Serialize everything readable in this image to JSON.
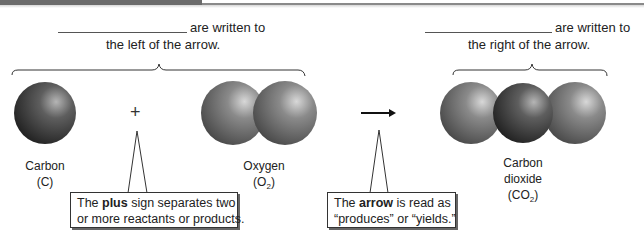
{
  "header": {
    "bar_color": "#6b6b6b",
    "rule_color": "#8a8a8a"
  },
  "reactants_prompt": {
    "blank": "",
    "line1": "are written to",
    "line2": "the left of the arrow."
  },
  "products_prompt": {
    "blank": "",
    "line1": "are written to",
    "line2": "the right of the arrow."
  },
  "symbols": {
    "plus": "+",
    "arrow": "→"
  },
  "molecules": [
    {
      "name": "Carbon",
      "formula_prefix": "(C",
      "formula_sub": "",
      "formula_suffix": ")",
      "atoms": 1
    },
    {
      "name": "Oxygen",
      "formula_prefix": "(O",
      "formula_sub": "2",
      "formula_suffix": ")",
      "atoms": 2
    },
    {
      "name_line1": "Carbon",
      "name_line2": "dioxide",
      "formula_prefix": "(CO",
      "formula_sub": "2",
      "formula_suffix": ")",
      "atoms": 3
    }
  ],
  "callouts": {
    "plus": {
      "pre": "The ",
      "bold": "plus",
      "post": " sign separates two",
      "line2": "or more reactants or products."
    },
    "arrow": {
      "pre": "The ",
      "bold": "arrow",
      "post": " is read as",
      "line2": "“produces” or “yields.”"
    }
  },
  "colors": {
    "atom_carbon": "#3a3a3a",
    "atom_oxygen": "#7a7a7a",
    "text": "#222222"
  }
}
